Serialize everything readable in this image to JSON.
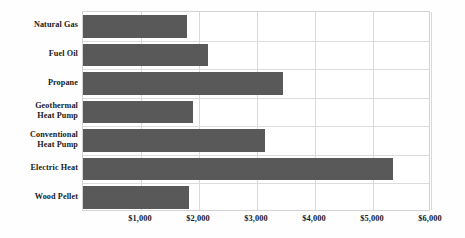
{
  "chart_data": {
    "type": "bar",
    "orientation": "horizontal",
    "title": "",
    "subtitle": "",
    "xlabel": "",
    "ylabel": "",
    "categories": [
      "Natural Gas",
      "Fuel Oil",
      "Propane",
      "Geothermal Heat Pump",
      "Conventional Heat Pump",
      "Electric Heat",
      "Wood Pellet"
    ],
    "category_label_lines": [
      [
        "Natural Gas"
      ],
      [
        "Fuel Oil"
      ],
      [
        "Propane"
      ],
      [
        "Geothermal",
        "Heat Pump"
      ],
      [
        "Conventional",
        "Heat Pump"
      ],
      [
        "Electric Heat"
      ],
      [
        "Wood Pellet"
      ]
    ],
    "values": [
      1790,
      2160,
      3450,
      1900,
      3140,
      5340,
      1830
    ],
    "xlim": [
      0,
      6000
    ],
    "x_tick_values": [
      1000,
      2000,
      3000,
      4000,
      5000,
      6000
    ],
    "x_tick_labels": [
      "$1,000",
      "$2,000",
      "$3,000",
      "$4,000",
      "$5,000",
      "$6,000"
    ],
    "grid": {
      "vertical": true,
      "horizontal": true
    },
    "legend": {
      "visible": false,
      "position": "none"
    },
    "colors": {
      "bar": "#595959",
      "gridline": "#d9d9d9",
      "plot_border": "#d3d3d3",
      "text": "#1a1a1a",
      "background": "#ffffff"
    }
  }
}
